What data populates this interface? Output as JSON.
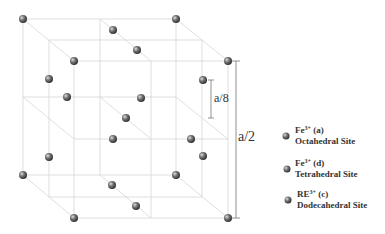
{
  "diagram": {
    "dimensions": {
      "a_over_8": "a/8",
      "a_over_2": "a/2"
    },
    "legend": [
      {
        "ion": "Fe",
        "charge": "3+",
        "site_letter": "(a)",
        "site": "Octahedral Site"
      },
      {
        "ion": "Fe",
        "charge": "3+",
        "site_letter": "(d)",
        "site": "Tetrahedral Site"
      },
      {
        "ion": "RE",
        "charge": "3+",
        "site_letter": "(c)",
        "site": "Dodecahedral Site"
      }
    ],
    "colors": {
      "line": "#d8d8d8",
      "sphere": "#666666",
      "text": "#333333"
    }
  }
}
